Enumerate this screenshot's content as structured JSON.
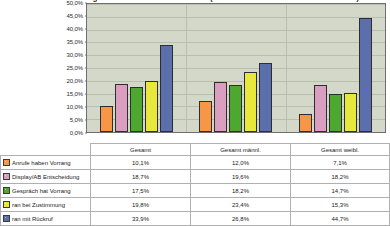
{
  "chart_data": {
    "type": "bar",
    "title": "Anrufe bei Vorrang bzw. Rückruf nach Geschlecht (Gesamt / Gesamt männl. / Gesamt weibl.)",
    "xlabel": "",
    "ylabel": "",
    "ylim": [
      0,
      50
    ],
    "ytick_labels": [
      "0,0%",
      "5,0%",
      "10,0%",
      "15,0%",
      "20,0%",
      "25,0%",
      "30,0%",
      "35,0%",
      "40,0%",
      "45,0%",
      "50,0%"
    ],
    "ytick_values": [
      0,
      5,
      10,
      15,
      20,
      25,
      30,
      35,
      40,
      45,
      50
    ],
    "grid": true,
    "legend_position": "bottom-table",
    "categories": [
      "Gesamt",
      "Gesamt männl.",
      "Gesamt weibl."
    ],
    "series": [
      {
        "name": "Anrufe haben Vorrang",
        "color": "#F79646",
        "values": [
          10.1,
          12.0,
          7.1
        ],
        "labels": [
          "10,1%",
          "12,0%",
          "7,1%"
        ]
      },
      {
        "name": "Display/AB Entscheidung",
        "color": "#DA9EC1",
        "values": [
          18.7,
          19.6,
          18.2
        ],
        "labels": [
          "18,7%",
          "19,6%",
          "18,2%"
        ]
      },
      {
        "name": "Gespräch hat Vorrang",
        "color": "#4EA72E",
        "values": [
          17.5,
          18.2,
          14.7
        ],
        "labels": [
          "17,5%",
          "18,2%",
          "14,7%"
        ]
      },
      {
        "name": "ran bei Zustimmung",
        "color": "#E8E73C",
        "values": [
          19.8,
          23.4,
          15.3
        ],
        "labels": [
          "19,8%",
          "23,4%",
          "15,3%"
        ]
      },
      {
        "name": "ran mit Rückruf",
        "color": "#5B6FAD",
        "values": [
          33.9,
          26.8,
          44.7
        ],
        "labels": [
          "33,9%",
          "26,8%",
          "44,7%"
        ]
      }
    ],
    "plot_background": "#D3D8C9",
    "gridline_color": "#B9BFAE"
  },
  "table": {
    "header": [
      "",
      "Gesamt",
      "Gesamt männl.",
      "Gesamt weibl."
    ],
    "rows": [
      {
        "label": "Anrufe haben Vorrang",
        "color": "#F79646",
        "cells": [
          "10,1%",
          "12,0%",
          "7,1%"
        ]
      },
      {
        "label": "Display/AB Entscheidung",
        "color": "#DA9EC1",
        "cells": [
          "18,7%",
          "19,6%",
          "18,2%"
        ]
      },
      {
        "label": "Gespräch hat Vorrang",
        "color": "#4EA72E",
        "cells": [
          "17,5%",
          "18,2%",
          "14,7%"
        ]
      },
      {
        "label": "ran bei Zustimmung",
        "color": "#E8E73C",
        "cells": [
          "19,8%",
          "23,4%",
          "15,3%"
        ]
      },
      {
        "label": "ran mit Rückruf",
        "color": "#5B6FAD",
        "cells": [
          "33,9%",
          "26,8%",
          "44,7%"
        ]
      }
    ]
  }
}
